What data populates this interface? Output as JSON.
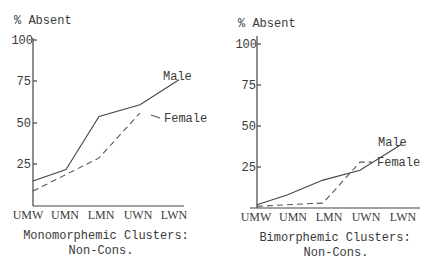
{
  "chart_data": [
    {
      "type": "line",
      "title": "Monomorphemic Clusters: Non-Cons.",
      "caption_lines": [
        "Monomorphemic Clusters:",
        "Non-Cons."
      ],
      "ylabel": "% Absent",
      "xlabel": "",
      "categories": [
        "UMW",
        "UMN",
        "LMN",
        "UWN",
        "LWN"
      ],
      "yticks": [
        25,
        50,
        75,
        100
      ],
      "ylim": [
        0,
        100
      ],
      "grid": false,
      "legend_position": "inline-right",
      "series": [
        {
          "name": "Male",
          "style": "solid",
          "values": [
            15,
            22,
            54,
            61,
            76
          ]
        },
        {
          "name": "Female",
          "style": "dashed",
          "values": [
            9,
            19,
            29,
            56,
            54
          ]
        }
      ]
    },
    {
      "type": "line",
      "title": "Bimorphemic Clusters: Non-Cons.",
      "caption_lines": [
        "Bimorphemic Clusters:",
        "Non-Cons."
      ],
      "ylabel": "% Absent",
      "xlabel": "",
      "categories": [
        "UMW",
        "UMN",
        "LMN",
        "UWN",
        "LWN"
      ],
      "yticks": [
        25,
        50,
        75,
        100
      ],
      "ylim": [
        0,
        100
      ],
      "grid": false,
      "legend_position": "inline-right",
      "series": [
        {
          "name": "Male",
          "style": "solid",
          "values": [
            2,
            8,
            17,
            23,
            39
          ]
        },
        {
          "name": "Female",
          "style": "dashed",
          "values": [
            1,
            2,
            3,
            28,
            28
          ]
        }
      ]
    }
  ],
  "charts": [
    {
      "ylabel": "% Absent",
      "ticks": [
        "25",
        "50",
        "75",
        "100"
      ],
      "xlabels": [
        "UMW",
        "UMN",
        "LMN",
        "UWN",
        "LWN"
      ],
      "legend_male": "Male",
      "legend_female": "Female",
      "caption_line1": "Monomorphemic Clusters:",
      "caption_line2": "Non-Cons."
    },
    {
      "ylabel": "% Absent",
      "ticks": [
        "25",
        "50",
        "75",
        "100"
      ],
      "xlabels": [
        "UMW",
        "UMN",
        "LMN",
        "UWN",
        "LWN"
      ],
      "legend_male": "Male",
      "legend_female": "Female",
      "caption_line1": "Bimorphemic Clusters:",
      "caption_line2": "Non-Cons."
    }
  ]
}
